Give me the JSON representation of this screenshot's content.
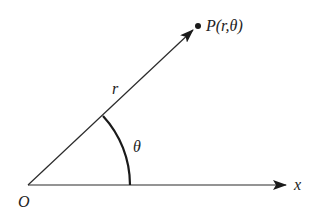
{
  "diagram": {
    "type": "polar-coordinates",
    "colors": {
      "stroke": "#2a2a2a",
      "background": "#ffffff"
    },
    "origin": {
      "label": "O",
      "x": 28,
      "y": 185
    },
    "x_axis": {
      "label": "x",
      "end_x": 286,
      "end_y": 185
    },
    "ray": {
      "label": "r",
      "end_x": 193,
      "end_y": 30
    },
    "point": {
      "label": "P(r,θ)",
      "x": 198,
      "y": 26
    },
    "angle": {
      "label": "θ"
    }
  }
}
